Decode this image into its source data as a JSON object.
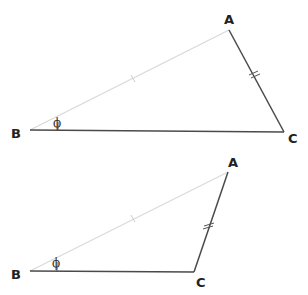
{
  "colors": {
    "dark_line": "#4a4a4a",
    "light_line": "#d8d8d8",
    "label": "#222222",
    "background": "#ffffff"
  },
  "triangles": [
    {
      "id": "top",
      "vertices": {
        "A": {
          "label": "A",
          "x": 229,
          "y": 30
        },
        "B": {
          "label": "B",
          "x": 30,
          "y": 130
        },
        "C": {
          "label": "C",
          "x": 284,
          "y": 132
        }
      },
      "angle_label": "ϕ",
      "angle_vertex": "B",
      "side_marks": {
        "AB": "single tick",
        "AC": "double tick"
      }
    },
    {
      "id": "bottom",
      "vertices": {
        "A": {
          "label": "A",
          "x": 228,
          "y": 172
        },
        "B": {
          "label": "B",
          "x": 30,
          "y": 271
        },
        "C": {
          "label": "C",
          "x": 194,
          "y": 272
        }
      },
      "angle_label": "ϕ",
      "angle_vertex": "B",
      "side_marks": {
        "AB": "single tick",
        "AC": "double tick"
      }
    }
  ]
}
